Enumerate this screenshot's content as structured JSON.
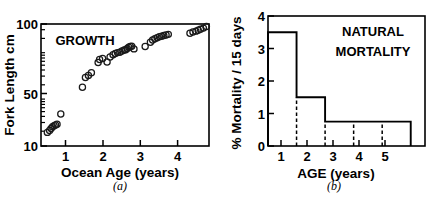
{
  "figure": {
    "panels": [
      {
        "caption": "(a)",
        "annotation": "GROWTH"
      },
      {
        "caption": "(b)",
        "annotation_line1": "NATURAL",
        "annotation_line2": "MORTALITY"
      }
    ]
  },
  "chart_data": [
    {
      "type": "scatter",
      "title": "GROWTH",
      "xlabel": "Ocean Age (years)",
      "ylabel": "Fork Length cm",
      "xlim": [
        0.35,
        4.85
      ],
      "ylim": [
        10,
        105
      ],
      "yscale": "log",
      "grid": false,
      "legend": null,
      "xticks": [
        1,
        2,
        3,
        4
      ],
      "xticklabels": [
        "1",
        "2",
        "3",
        "4"
      ],
      "yticks": [
        10,
        50,
        100
      ],
      "yticklabels": [
        "10",
        "50",
        "100"
      ],
      "yminorticks": [
        20,
        30,
        40,
        60,
        70,
        80,
        90
      ],
      "marker": "open-circle",
      "x": [
        0.52,
        0.58,
        0.62,
        0.66,
        0.7,
        0.74,
        0.78,
        0.88,
        1.46,
        1.54,
        1.62,
        1.7,
        1.88,
        1.92,
        2.0,
        2.12,
        2.2,
        2.28,
        2.34,
        2.4,
        2.46,
        2.52,
        2.58,
        2.62,
        2.66,
        2.7,
        2.74,
        2.78,
        2.84,
        3.14,
        3.28,
        3.34,
        3.4,
        3.46,
        3.52,
        3.58,
        3.64,
        3.7,
        3.76,
        4.34,
        4.42,
        4.5,
        4.56,
        4.62,
        4.7,
        4.78
      ],
      "y": [
        13.0,
        13.5,
        14.0,
        14.5,
        14.8,
        15.0,
        15.2,
        18.5,
        31.0,
        37.5,
        39.0,
        41.0,
        50.0,
        53.0,
        54.0,
        50.5,
        55.5,
        58.0,
        59.5,
        60.5,
        61.0,
        62.5,
        63.5,
        64.0,
        65.5,
        67.0,
        68.0,
        68.5,
        65.0,
        68.0,
        74.0,
        77.0,
        79.0,
        80.5,
        82.0,
        83.0,
        84.0,
        85.0,
        86.0,
        88.0,
        90.0,
        91.5,
        93.0,
        95.0,
        97.0,
        100.0
      ]
    },
    {
      "type": "bar",
      "title": "NATURAL MORTALITY",
      "xlabel": "AGE (years)",
      "ylabel": "% Mortality / 15 days",
      "xlim": [
        0.5,
        6.0
      ],
      "ylim": [
        0,
        4
      ],
      "grid": false,
      "legend": null,
      "xticks": [
        1,
        2,
        3,
        4,
        5
      ],
      "xticklabels": [
        "1",
        "2",
        "3",
        "4",
        "5"
      ],
      "yticks": [
        0,
        1,
        2,
        3,
        4
      ],
      "yticklabels": [
        "0",
        "1",
        "2",
        "3",
        "4"
      ],
      "categories": [
        "1",
        "2",
        "3",
        "4",
        "5"
      ],
      "values": [
        3.5,
        1.5,
        0.75,
        0.75,
        0.75
      ],
      "bin_edges": [
        0.5,
        1.5,
        2.5,
        3.5,
        4.5,
        5.5
      ],
      "dashed_dividers": [
        1.5,
        2.5,
        3.5,
        4.5
      ]
    }
  ]
}
